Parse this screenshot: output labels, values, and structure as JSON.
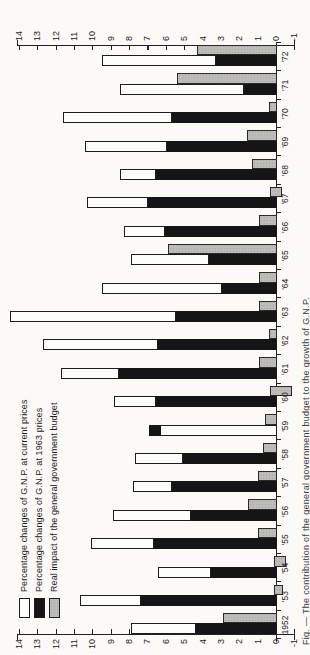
{
  "legend": {
    "items": [
      {
        "swatch": "white",
        "label": "Percentage changes of G.N.P. at current prices"
      },
      {
        "swatch": "black",
        "label": "Percentage changes of G.N.P. at 1963 prices"
      },
      {
        "swatch": "gray",
        "label": "Real impact of the general government budget"
      }
    ]
  },
  "caption": "Fig. — The contribution of the general government budget to the growth of G.N.P.",
  "chart_data": {
    "type": "bar",
    "title": "",
    "xlabel": "",
    "ylabel": "",
    "categories": [
      "1952",
      "'53",
      "'54",
      "'55",
      "'56",
      "'57",
      "'58",
      "'59",
      "'60",
      "'61",
      "'62",
      "'63",
      "'64",
      "'65",
      "'66",
      "'67",
      "'68",
      "'69",
      "'70",
      "'71",
      "'72"
    ],
    "series": [
      {
        "name": "Percentage changes of G.N.P. at current prices",
        "values": [
          7.9,
          10.7,
          6.4,
          10.1,
          8.9,
          7.8,
          7.7,
          6.3,
          8.8,
          11.7,
          12.7,
          14.5,
          9.5,
          7.9,
          8.3,
          10.3,
          8.5,
          10.4,
          11.6,
          8.5,
          9.5
        ]
      },
      {
        "name": "Percentage changes of G.N.P. at 1963 prices",
        "values": [
          4.4,
          7.4,
          3.6,
          6.7,
          4.7,
          5.7,
          5.1,
          6.9,
          6.6,
          8.6,
          6.5,
          5.5,
          3.0,
          3.7,
          6.1,
          7.0,
          6.6,
          6.0,
          5.7,
          1.8,
          3.3
        ]
      },
      {
        "name": "Real impact of the general government budget",
        "values": [
          2.9,
          -0.2,
          -0.5,
          1.0,
          1.5,
          1.0,
          0.7,
          0.6,
          -0.8,
          0.9,
          0.4,
          0.9,
          0.9,
          5.9,
          0.9,
          0.3,
          1.3,
          1.6,
          0.4,
          5.4,
          4.3
        ]
      }
    ],
    "budget_bar_spans_override": {
      "'53": [
        -0.3,
        0.1
      ],
      "'54": [
        -0.5,
        0.1
      ],
      "'60": [
        -0.8,
        0.3
      ],
      "'67": [
        -0.25,
        0.3
      ]
    },
    "ylim": [
      -1,
      14
    ],
    "ytick_step": 1,
    "axis_ticks": [
      14,
      13,
      12,
      11,
      10,
      9,
      8,
      7,
      6,
      5,
      4,
      3,
      2,
      1,
      0,
      -1
    ],
    "grid": false,
    "legend_position": "top-left",
    "note": "Chart printed rotated 90deg CCW on portrait page; value axis labelled on both sides; stacked columns: black = real (1963 prices) growth, white = up to nominal growth (in 1959 real exceeds nominal so black tip sits above white); gray companion column = budget impact."
  }
}
